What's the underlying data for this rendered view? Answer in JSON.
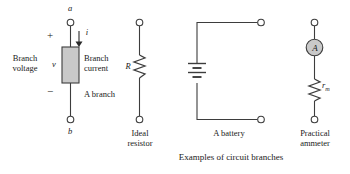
{
  "figure": {
    "caption": "Examples of circuit branches",
    "background_color": "#ffffff",
    "line_color": "#3d3d3d",
    "fill_gray": "#c9c9c9"
  },
  "branches": [
    {
      "id": "generic-branch",
      "node_top_label": "a",
      "node_bottom_label": "b",
      "polarity_plus": "+",
      "polarity_minus": "−",
      "voltage_symbol": "v",
      "current_symbol": "i",
      "label_left": "Branch\nvoltage",
      "label_right_current": "Branch\ncurrent",
      "label_right_branch": "A branch"
    },
    {
      "id": "ideal-resistor",
      "symbol": "R",
      "caption": "Ideal\nresistor"
    },
    {
      "id": "battery",
      "caption": "A battery"
    },
    {
      "id": "practical-ammeter",
      "meter_symbol": "A",
      "resistance_symbol": "r",
      "resistance_subscript": "m",
      "caption": "Practical\nammeter"
    }
  ]
}
